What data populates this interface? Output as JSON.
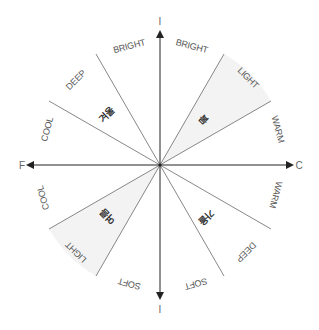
{
  "diagram": {
    "center": [
      160,
      165
    ],
    "axes": {
      "top_label": "I",
      "bottom_label": "I",
      "left_label": "F",
      "right_label": "C"
    },
    "wedge_fill": "#f3f3f3",
    "line_color": "#666666",
    "axis_color": "#222222",
    "shaded_sectors": [
      {
        "season": "봄",
        "from_deg": 30,
        "to_deg": 60
      },
      {
        "season": "여름",
        "from_deg": 210,
        "to_deg": 240
      }
    ],
    "seasons": {
      "spring": "봄",
      "winter": "겨울",
      "summer": "여름",
      "autumn": "가을"
    },
    "sector_labels": {
      "upper_left_bright": "BRIGHT",
      "upper_right_bright": "BRIGHT",
      "light_top": "LIGHT",
      "warm_top": "WARM",
      "warm_bottom": "WARM",
      "deep_bottom": "DEEP",
      "soft_right": "SOFT",
      "soft_left": "SOFT",
      "light_bottom": "LIGHT",
      "cool_bottom": "COOL",
      "cool_top": "COOL",
      "deep_top": "DEEP"
    }
  }
}
